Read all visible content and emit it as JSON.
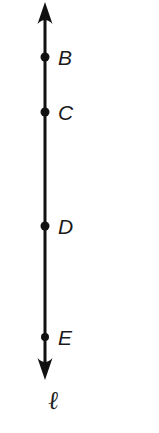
{
  "figure": {
    "kind": "geometry-line-diagram",
    "width": 159,
    "height": 433,
    "background_color": "#ffffff",
    "stroke_color": "#111111",
    "label_color": "#1a1a1a",
    "line": {
      "name": "line-l",
      "label": "ℓ",
      "label_x": 48,
      "label_y": 388,
      "orientation": "vertical",
      "x": 45,
      "top_y": 2,
      "bottom_y": 380,
      "stroke_width": 3,
      "arrow_top": true,
      "arrow_bottom": true,
      "arrow_head_width": 15,
      "arrow_head_length": 22
    },
    "points": [
      {
        "label": "B",
        "x": 45,
        "y": 57,
        "radius": 4.5,
        "label_x": 58,
        "label_y": 47
      },
      {
        "label": "C",
        "x": 45,
        "y": 112,
        "radius": 4.5,
        "label_x": 58,
        "label_y": 102
      },
      {
        "label": "D",
        "x": 45,
        "y": 226,
        "radius": 4.5,
        "label_x": 58,
        "label_y": 216
      },
      {
        "label": "E",
        "x": 45,
        "y": 337,
        "radius": 4.0,
        "label_x": 58,
        "label_y": 327
      }
    ]
  }
}
